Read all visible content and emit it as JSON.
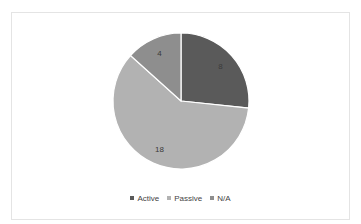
{
  "chart_data": {
    "type": "pie",
    "title": "",
    "categories": [
      "Active",
      "Passive",
      "N/A"
    ],
    "values": [
      8,
      18,
      4
    ],
    "colors": [
      "#5a5a5a",
      "#b2b2b2",
      "#8e8e8e"
    ],
    "start_angle_deg": 0,
    "direction": "clockwise",
    "data_labels": [
      "8",
      "18",
      "4"
    ],
    "legend_position": "bottom"
  },
  "legend": {
    "items": [
      {
        "label": "Active",
        "color": "#5a5a5a"
      },
      {
        "label": "Passive",
        "color": "#b2b2b2"
      },
      {
        "label": "N/A",
        "color": "#8e8e8e"
      }
    ]
  }
}
